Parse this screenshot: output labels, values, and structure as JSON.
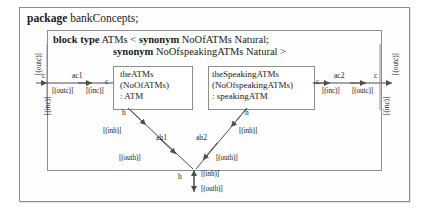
{
  "diagram": {
    "package_keyword": "package",
    "package_name": "bankConcepts;",
    "blocktype_keyword": "block type",
    "blocktype_line1": " ATMs < ",
    "synonym_keyword1": "synonym",
    "synonym_text1": " NoOfATMs Natural;",
    "synonym_keyword2": "synonym",
    "synonym_text2": " NoOfspeakingATMs Natural >",
    "parts": [
      {
        "name": "theATMs",
        "value": "(NoOfATMs)",
        "type": ": ATM",
        "port_c": "c",
        "port_h": "h"
      },
      {
        "name": "theSpeakingATMs",
        "value": "(NoOfspeakingATMs)",
        "type": ": speakingATM",
        "port_c": "c",
        "port_h": "h"
      }
    ],
    "connectors": {
      "ac1": "ac1",
      "ac2": "ac2",
      "ah1": "ah1",
      "ah2": "ah2"
    },
    "ports": {
      "left_outer_c": "c",
      "right_outer_c": "c",
      "bottom_outer_h": "h"
    },
    "flows": {
      "inc": "[(inc)]",
      "outc": "[(outc)]",
      "inh": "[(inh)]",
      "outh": "[(outh)]"
    },
    "labels": {
      "left_outer_outc": "[(outc)]",
      "left_outer_inc": "[(inc)]",
      "left_ac1_outc": "[(outc)]",
      "left_ac1_inc": "[(inc)]",
      "right_ac2_inc": "[(inc)]",
      "right_ac2_outc": "[(outc)]",
      "right_outer_outc": "[(outc)]",
      "right_outer_inc": "[(inc)]",
      "ah1_inh": "[(inh)]",
      "ah1_outh": "[(outh)]",
      "ah2_inh": "[(inh)]",
      "ah2_outh": "[(outh)]",
      "bottom_inh": "[(inh)]",
      "bottom_outh": "[(outh)]"
    },
    "colors": {
      "frame_border": "#8d8d8d",
      "line": "#4d4d4d",
      "text": "#1a1a1a",
      "background": "#ffffff"
    }
  }
}
